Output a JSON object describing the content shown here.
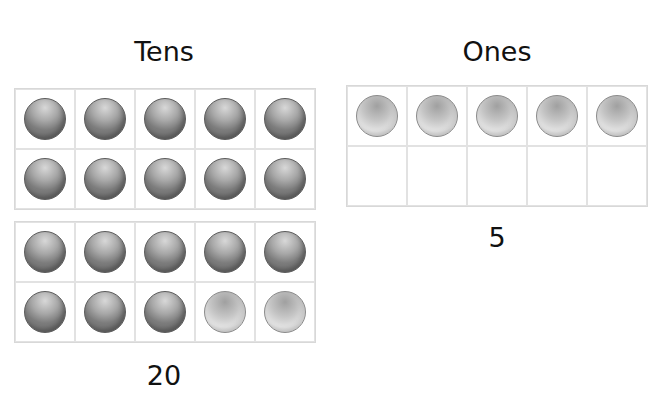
{
  "tens": {
    "title": "Tens",
    "value": "20",
    "frames": [
      {
        "filled": [
          "dark",
          "dark",
          "dark",
          "dark",
          "dark",
          "dark",
          "dark",
          "dark",
          "dark",
          "dark"
        ]
      },
      {
        "filled": [
          "dark",
          "dark",
          "dark",
          "dark",
          "dark",
          "dark",
          "dark",
          "dark",
          "light",
          "light"
        ]
      }
    ]
  },
  "ones": {
    "title": "Ones",
    "value": "5",
    "frames": [
      {
        "filled": [
          "light",
          "light",
          "light",
          "light",
          "light",
          "",
          "",
          "",
          "",
          ""
        ]
      }
    ]
  },
  "colors": {
    "dark_counter": "#7c7c7c",
    "light_counter": "#d4d4d4",
    "grid_line": "#e2e2e2"
  }
}
